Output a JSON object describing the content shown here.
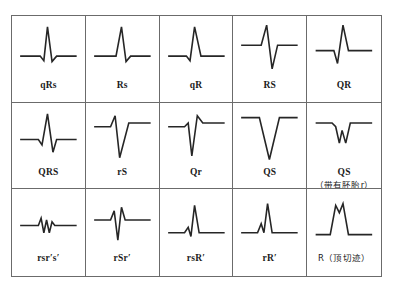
{
  "figure": {
    "kind": "qrs-complex-nomenclature-table",
    "rows": 3,
    "columns": 5,
    "border_color": "#6b6b6b",
    "trace_color": "#262626",
    "background": "#ffffff"
  },
  "cells": [
    {
      "id": "qRs",
      "label": "qRs",
      "sublabel": "",
      "waveform": "small q dip, tall sharp R spike, small s dip, return to baseline",
      "points": "8,44 30,44 34,49 38,12 43,50 48,44 70,44"
    },
    {
      "id": "Rs",
      "label": "Rs",
      "sublabel": "",
      "waveform": "flat baseline, tall sharp R spike, small s dip, return to baseline",
      "points": "8,44 32,44 38,12 43,50 48,44 70,44"
    },
    {
      "id": "qR",
      "label": "qR",
      "sublabel": "",
      "waveform": "small q dip, tall R spike, return to baseline with no s",
      "points": "8,44 28,44 32,49 37,12 44,44 70,44"
    },
    {
      "id": "RS",
      "label": "RS",
      "sublabel": "",
      "waveform": "R spike up from high baseline, deep S below baseline, return",
      "points": "8,32 30,32 36,10 42,58 48,32 70,32"
    },
    {
      "id": "QR",
      "label": "QR",
      "sublabel": "",
      "waveform": "Q deflection down, tall R spike up, return to baseline",
      "points": "8,38 28,38 32,52 38,10 44,38 70,38"
    },
    {
      "id": "QRS",
      "label": "QRS",
      "sublabel": "",
      "waveform": "small q, tall R spike, s below baseline, return",
      "points": "8,40 28,40 32,46 38,12 44,54 48,40 70,40"
    },
    {
      "id": "rS",
      "label": "rS",
      "sublabel": "",
      "waveform": "small r up, very deep S below baseline, return to baseline",
      "points": "8,26 26,26 31,14 36,60 46,22 70,22"
    },
    {
      "id": "Qr",
      "label": "Qr",
      "sublabel": "",
      "waveform": "Q down deep, small r up, return",
      "points": "8,26 26,26 30,22 34,58 40,14 46,22 70,22"
    },
    {
      "id": "QS",
      "label": "QS",
      "sublabel": "",
      "waveform": "deep V-shaped negative QS deflection, no positive deflection",
      "points": "8,16 28,16 39,62 50,16 70,16"
    },
    {
      "id": "QS-embryonic-r",
      "label": "QS",
      "sublabel": "（带有胚胎r）",
      "waveform": "QS with tiny embryonic r notch inside the negative deflection",
      "points": "8,22 26,22 30,26 34,44 37,30 41,44 46,22 70,22"
    },
    {
      "id": "rsr's'",
      "label": "rsr′s′",
      "sublabel": "",
      "waveform": "low amplitude multiphasic zigzag: r, s, r', s' all small",
      "points": "8,40 28,40 31,32 34,48 37,34 40,48 43,36 46,40 70,40"
    },
    {
      "id": "rSr'",
      "label": "rSr′",
      "sublabel": "",
      "waveform": "small r up, deep S down, then r' up above baseline, return",
      "points": "8,34 26,34 30,24 34,56 38,20 42,34 70,34"
    },
    {
      "id": "rsR'",
      "label": "rsR′",
      "sublabel": "",
      "waveform": "small r, small s dip, then tall R' spike, return",
      "points": "8,48 26,48 30,42 33,52 37,18 42,48 70,48"
    },
    {
      "id": "rR'",
      "label": "rR′",
      "sublabel": "",
      "waveform": "small r up, brief dip, tall R' spike, return",
      "points": "8,48 26,48 30,38 33,48 37,16 42,48 70,48"
    },
    {
      "id": "R-notched-top",
      "label": "R（顶切迹）",
      "sublabel": "",
      "waveform": "broad tall R wave with a notch at the top of the peak",
      "points": "8,50 24,50 30,18 34,26 38,16 44,50 70,50"
    }
  ]
}
